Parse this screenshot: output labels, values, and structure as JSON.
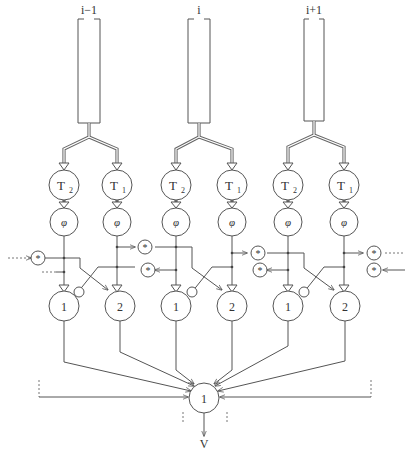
{
  "diagram": {
    "type": "neural-network-schematic",
    "columns": [
      {
        "label": "i−1",
        "timers": [
          {
            "label": "T",
            "sub": "2"
          },
          {
            "label": "T",
            "sub": "1"
          }
        ],
        "phi": [
          "φ",
          "φ"
        ],
        "outputs": [
          "1",
          "2"
        ]
      },
      {
        "label": "i",
        "timers": [
          {
            "label": "T",
            "sub": "2"
          },
          {
            "label": "T",
            "sub": "1"
          }
        ],
        "phi": [
          "φ",
          "φ"
        ],
        "outputs": [
          "1",
          "2"
        ]
      },
      {
        "label": "i+1",
        "timers": [
          {
            "label": "T",
            "sub": "2"
          },
          {
            "label": "T",
            "sub": "1"
          }
        ],
        "phi": [
          "φ",
          "φ"
        ],
        "outputs": [
          "1",
          "2"
        ]
      }
    ],
    "multiplier_symbol": "*",
    "summation_node": {
      "label": "1"
    },
    "output_label": "V"
  }
}
